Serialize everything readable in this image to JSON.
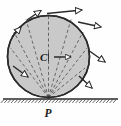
{
  "figure": {
    "labels": {
      "center": "C",
      "contact_point": "P"
    },
    "colors": {
      "disk_fill": "#c9c9c9",
      "outline": "#2b2b2b",
      "dashed_line": "#4a4a4a",
      "arrow_stroke": "#2b2b2b",
      "arrow_fill": "#ffffff",
      "ground": "#2b2b2b",
      "background": "#fefefe"
    },
    "geometry": {
      "circle_cx": 48.5,
      "circle_cy": 56.5,
      "circle_r": 41,
      "contact_x": 48.5,
      "contact_y": 97.5,
      "ground_y": 99,
      "ground_x1": 3,
      "ground_x2": 118
    },
    "center_velocity_arrow": {
      "name": "center-velocity-vector",
      "x1": 54,
      "y1": 57,
      "x2": 71,
      "y2": 57
    },
    "dashed_radii": [
      {
        "x2": 10.5,
        "y2": 48.0
      },
      {
        "x2": 14.0,
        "y2": 32.0
      },
      {
        "x2": 26.0,
        "y2": 19.5
      },
      {
        "x2": 48.5,
        "y2": 15.5
      },
      {
        "x2": 71.0,
        "y2": 19.5
      },
      {
        "x2": 83.0,
        "y2": 32.0
      },
      {
        "x2": 87.0,
        "y2": 48.0
      },
      {
        "x2": 85.0,
        "y2": 68.0
      }
    ],
    "velocity_arrows": [
      {
        "name": "velocity-arrow-top",
        "x1": 47.0,
        "y1": 13.5,
        "x2": 82.0,
        "y2": 10.0
      },
      {
        "name": "velocity-arrow-upper-left",
        "x1": 27.0,
        "y1": 20.0,
        "x2": 41.0,
        "y2": 10.5
      },
      {
        "name": "velocity-arrow-left",
        "x1": 12.0,
        "y1": 37.0,
        "x2": 21.0,
        "y2": 27.0
      },
      {
        "name": "velocity-arrow-lower-left",
        "x1": 13.0,
        "y1": 66.0,
        "x2": 28.0,
        "y2": 77.0
      },
      {
        "name": "velocity-arrow-upper-right",
        "x1": 78.0,
        "y1": 22.0,
        "x2": 101.0,
        "y2": 27.0
      },
      {
        "name": "velocity-arrow-right",
        "x1": 88.0,
        "y1": 50.0,
        "x2": 105.0,
        "y2": 62.0
      },
      {
        "name": "velocity-arrow-lower-right",
        "x1": 79.0,
        "y1": 76.0,
        "x2": 92.0,
        "y2": 88.0
      }
    ],
    "ground_hatching": {
      "count": 34,
      "spacing": 3.4,
      "length": 5
    }
  }
}
